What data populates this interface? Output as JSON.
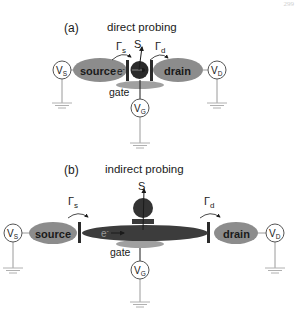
{
  "page_number": "299",
  "panel_a": {
    "label": "(a)",
    "title": "direct probing",
    "source_label": "source",
    "drain_label": "drain",
    "gate_label": "gate",
    "electron_label": "e",
    "gamma_s": "Γ",
    "gamma_s_sub": "s",
    "gamma_d": "Γ",
    "gamma_d_sub": "d",
    "signal_label": "S",
    "vs_label": "V",
    "vs_sub": "S",
    "vd_label": "V",
    "vd_sub": "D",
    "vg_label": "V",
    "vg_sub": "G"
  },
  "panel_b": {
    "label": "(b)",
    "title": "indirect probing",
    "source_label": "source",
    "drain_label": "drain",
    "gate_label": "gate",
    "electron_label": "e",
    "gamma_s": "Γ",
    "gamma_s_sub": "s",
    "gamma_d": "Γ",
    "gamma_d_sub": "d",
    "signal_label": "S",
    "vs_label": "V",
    "vs_sub": "S",
    "vd_label": "V",
    "vd_sub": "D",
    "vg_label": "V",
    "vg_sub": "G"
  },
  "colors": {
    "reservoir": "#8c8c8c",
    "dot": "#2a2a2a",
    "channel": "#3c3c3c",
    "gate": "#a0a0a0",
    "barrier": "#2b2b2b",
    "wire": "#9a9a9a",
    "line": "#1a1a1a"
  }
}
